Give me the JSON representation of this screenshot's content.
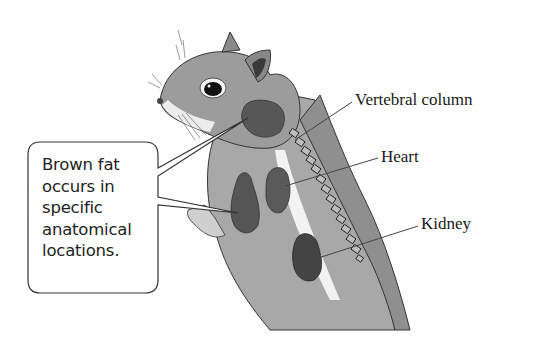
{
  "diagram": {
    "callout": {
      "lines": [
        "Brown fat",
        "occurs in",
        "specific",
        "anatomical",
        "locations."
      ]
    },
    "labels": {
      "vertebral_column": "Vertebral column",
      "heart": "Heart",
      "kidney": "Kidney"
    },
    "colors": {
      "fur": "#9a9a9a",
      "brown_fat": "#555555",
      "outline": "#2a2a2a",
      "background": "#ffffff"
    }
  }
}
